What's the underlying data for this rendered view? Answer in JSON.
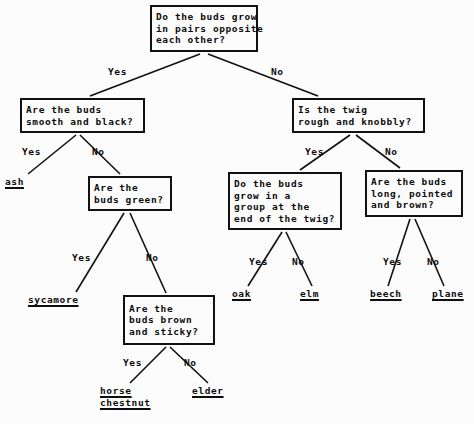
{
  "diagram": {
    "type": "decision-tree",
    "background_color": "#fcfcfc",
    "line_color": "#111111",
    "text_color": "#0d0d0d"
  },
  "nodes": [
    {
      "id": "root",
      "kind": "question",
      "lines": [
        "Do the buds grow",
        "in pairs opposite",
        "each other?"
      ],
      "x": 150,
      "y": 5,
      "w": 108,
      "h": 47
    },
    {
      "id": "q_smooth_black",
      "kind": "question",
      "lines": [
        "Are the buds",
        "smooth and black?"
      ],
      "x": 20,
      "y": 98,
      "w": 125,
      "h": 35
    },
    {
      "id": "q_twig_rough",
      "kind": "question",
      "lines": [
        "Is the twig",
        "rough and knobbly?"
      ],
      "x": 292,
      "y": 98,
      "w": 133,
      "h": 35
    },
    {
      "id": "q_buds_green",
      "kind": "question",
      "lines": [
        "Are the",
        "buds green?"
      ],
      "x": 88,
      "y": 176,
      "w": 84,
      "h": 35
    },
    {
      "id": "q_group_end",
      "kind": "question",
      "lines": [
        "Do the buds",
        "grow in a",
        "group at the",
        "end of the twig?"
      ],
      "x": 228,
      "y": 172,
      "w": 114,
      "h": 58
    },
    {
      "id": "q_long_pointed",
      "kind": "question",
      "lines": [
        "Are the buds",
        "long, pointed",
        "and brown?"
      ],
      "x": 365,
      "y": 170,
      "w": 98,
      "h": 47
    },
    {
      "id": "q_brown_sticky",
      "kind": "question",
      "lines": [
        "Are the",
        "buds brown",
        "and sticky?"
      ],
      "x": 123,
      "y": 295,
      "w": 92,
      "h": 50
    }
  ],
  "leaves": [
    {
      "id": "leaf_ash",
      "lines": [
        "ash"
      ],
      "x": 5,
      "y": 176
    },
    {
      "id": "leaf_sycamore",
      "lines": [
        "sycamore"
      ],
      "x": 28,
      "y": 294
    },
    {
      "id": "leaf_oak",
      "lines": [
        "oak"
      ],
      "x": 232,
      "y": 288
    },
    {
      "id": "leaf_elm",
      "lines": [
        "elm"
      ],
      "x": 300,
      "y": 288
    },
    {
      "id": "leaf_beech",
      "lines": [
        "beech"
      ],
      "x": 370,
      "y": 288
    },
    {
      "id": "leaf_plane",
      "lines": [
        "plane"
      ],
      "x": 432,
      "y": 288
    },
    {
      "id": "leaf_horse_chestnut",
      "lines": [
        "horse",
        "chestnut"
      ],
      "x": 100,
      "y": 385
    },
    {
      "id": "leaf_elder",
      "lines": [
        "elder"
      ],
      "x": 192,
      "y": 385
    }
  ],
  "edge_labels": [
    {
      "id": "lbl_root_yes",
      "text": "Yes",
      "x": 108,
      "y": 66
    },
    {
      "id": "lbl_root_no",
      "text": "No",
      "x": 271,
      "y": 66
    },
    {
      "id": "lbl_smooth_yes",
      "text": "Yes",
      "x": 22,
      "y": 146
    },
    {
      "id": "lbl_smooth_no",
      "text": "No",
      "x": 92,
      "y": 146
    },
    {
      "id": "lbl_twig_yes",
      "text": "Yes",
      "x": 305,
      "y": 146
    },
    {
      "id": "lbl_twig_no",
      "text": "No",
      "x": 385,
      "y": 146
    },
    {
      "id": "lbl_green_yes",
      "text": "Yes",
      "x": 72,
      "y": 252
    },
    {
      "id": "lbl_green_no",
      "text": "No",
      "x": 146,
      "y": 252
    },
    {
      "id": "lbl_group_yes",
      "text": "Yes",
      "x": 249,
      "y": 256
    },
    {
      "id": "lbl_group_no",
      "text": "No",
      "x": 292,
      "y": 256
    },
    {
      "id": "lbl_long_yes",
      "text": "Yes",
      "x": 383,
      "y": 256
    },
    {
      "id": "lbl_long_no",
      "text": "No",
      "x": 427,
      "y": 256
    },
    {
      "id": "lbl_sticky_yes",
      "text": "Yes",
      "x": 123,
      "y": 357
    },
    {
      "id": "lbl_sticky_no",
      "text": "No",
      "x": 184,
      "y": 357
    }
  ],
  "edges": [
    {
      "id": "edge-root-yes",
      "from": "root",
      "to": "q_smooth_black",
      "answer": "Yes",
      "x1": 200,
      "y1": 54,
      "x2": 90,
      "y2": 96
    },
    {
      "id": "edge-root-no",
      "from": "root",
      "to": "q_twig_rough",
      "answer": "No",
      "x1": 208,
      "y1": 54,
      "x2": 318,
      "y2": 96
    },
    {
      "id": "edge-smooth-yes",
      "from": "q_smooth_black",
      "to": "leaf_ash",
      "answer": "Yes",
      "x1": 76,
      "y1": 135,
      "x2": 28,
      "y2": 174
    },
    {
      "id": "edge-smooth-no",
      "from": "q_smooth_black",
      "to": "q_buds_green",
      "answer": "No",
      "x1": 80,
      "y1": 135,
      "x2": 120,
      "y2": 174
    },
    {
      "id": "edge-twig-yes",
      "from": "q_twig_rough",
      "to": "q_group_end",
      "answer": "Yes",
      "x1": 350,
      "y1": 135,
      "x2": 300,
      "y2": 170
    },
    {
      "id": "edge-twig-no",
      "from": "q_twig_rough",
      "to": "q_long_pointed",
      "answer": "No",
      "x1": 356,
      "y1": 135,
      "x2": 400,
      "y2": 168
    },
    {
      "id": "edge-green-yes",
      "from": "q_buds_green",
      "to": "leaf_sycamore",
      "answer": "Yes",
      "x1": 124,
      "y1": 213,
      "x2": 76,
      "y2": 292
    },
    {
      "id": "edge-green-no",
      "from": "q_buds_green",
      "to": "q_brown_sticky",
      "answer": "No",
      "x1": 130,
      "y1": 213,
      "x2": 166,
      "y2": 293
    },
    {
      "id": "edge-group-yes",
      "from": "q_group_end",
      "to": "leaf_oak",
      "answer": "Yes",
      "x1": 282,
      "y1": 232,
      "x2": 248,
      "y2": 286
    },
    {
      "id": "edge-group-no",
      "from": "q_group_end",
      "to": "leaf_elm",
      "answer": "No",
      "x1": 286,
      "y1": 232,
      "x2": 312,
      "y2": 286
    },
    {
      "id": "edge-long-yes",
      "from": "q_long_pointed",
      "to": "leaf_beech",
      "answer": "Yes",
      "x1": 410,
      "y1": 219,
      "x2": 388,
      "y2": 286
    },
    {
      "id": "edge-long-no",
      "from": "q_long_pointed",
      "to": "leaf_plane",
      "answer": "No",
      "x1": 415,
      "y1": 219,
      "x2": 444,
      "y2": 286
    },
    {
      "id": "edge-sticky-yes",
      "from": "q_brown_sticky",
      "to": "leaf_horse_chestnut",
      "answer": "Yes",
      "x1": 166,
      "y1": 347,
      "x2": 130,
      "y2": 383
    },
    {
      "id": "edge-sticky-no",
      "from": "q_brown_sticky",
      "to": "leaf_elder",
      "answer": "No",
      "x1": 170,
      "y1": 347,
      "x2": 208,
      "y2": 383
    }
  ]
}
